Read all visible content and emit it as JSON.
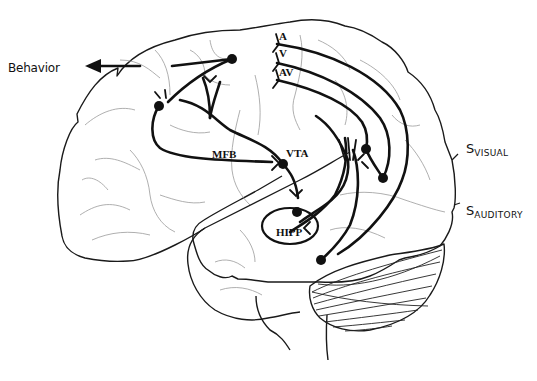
{
  "figure": {
    "type": "Lateral view schematic of the human brain showing dopaminergic and sensory pathways",
    "labels": {
      "behavior": "Behavior",
      "a": "A",
      "v": "V",
      "av": "AV",
      "mfb": "MFB",
      "vta": "VTA",
      "hipp": "HIPP",
      "s_visual_main": "S",
      "s_visual_sub": "VISUAL",
      "s_auditory_main": "S",
      "s_auditory_sub": "AUDITORY"
    },
    "colors": {
      "pathway": "#111111",
      "outline": "#1a1a1a",
      "sulci": "#9a9a9a",
      "background": "#ffffff"
    },
    "nodes": [
      {
        "name": "frontal-output-node",
        "x": 232,
        "y": 59
      },
      {
        "name": "prefrontal-node",
        "x": 159,
        "y": 106
      },
      {
        "name": "vta-node",
        "x": 283,
        "y": 164
      },
      {
        "name": "hipp-node",
        "x": 297,
        "y": 212
      },
      {
        "name": "visual-relay-node",
        "x": 366,
        "y": 149
      },
      {
        "name": "visual-end-node",
        "x": 383,
        "y": 178
      },
      {
        "name": "auditory-node",
        "x": 321,
        "y": 260
      }
    ]
  }
}
